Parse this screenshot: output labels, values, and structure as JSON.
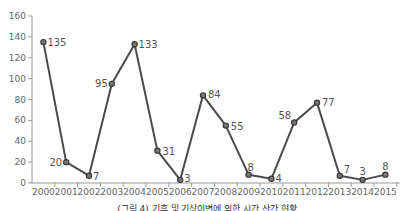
{
  "chart_data": {
    "type": "line",
    "title": "",
    "caption": "(그림 4) 기후 및 기상이변에 의한 시간 산간 현황",
    "xlabel": "",
    "ylabel": "",
    "categories": [
      "2000",
      "2001",
      "2002",
      "2003",
      "2004",
      "2005",
      "2006",
      "2007",
      "2008",
      "2009",
      "2010",
      "2011",
      "2012",
      "2013",
      "2014",
      "2015"
    ],
    "series": [
      {
        "name": "series-1",
        "values": [
          135,
          20,
          7,
          95,
          133,
          31,
          3,
          84,
          55,
          8,
          4,
          58,
          77,
          7,
          3,
          8
        ]
      }
    ],
    "data_labels": [
      "135",
      "20",
      "7",
      "95",
      "133",
      "31",
      "3",
      "84",
      "55",
      "8",
      "4",
      "58",
      "77",
      "7",
      "3",
      "8"
    ],
    "y_ticks": [
      0,
      20,
      40,
      60,
      80,
      100,
      120,
      140,
      160
    ],
    "ylim": [
      0,
      160
    ],
    "grid": false,
    "legend": "none",
    "colors": {
      "line": "#4a4a4a",
      "marker": "#3a3a3a",
      "axis": "#999999",
      "text": "#666666"
    }
  }
}
